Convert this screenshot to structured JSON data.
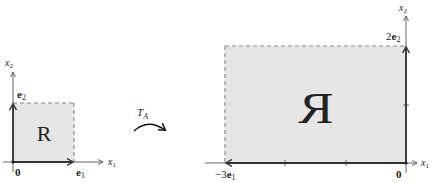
{
  "figure": {
    "colors": {
      "region_fill": "#e6e6e6",
      "axis": "#555555",
      "dashed_edge": "#8a8a8a",
      "text": "#222222",
      "background": "#ffffff"
    },
    "left_panel": {
      "axis_x_label": "x",
      "axis_x_sub": "1",
      "axis_y_label": "x",
      "axis_y_sub": "2",
      "origin_label": "0",
      "e1_label": "e",
      "e1_sub": "1",
      "e2_label": "e",
      "e2_sub": "2",
      "region_letter": "R"
    },
    "transform": {
      "label": "T",
      "label_sub": "A"
    },
    "right_panel": {
      "axis_x_label": "x",
      "axis_x_sub": "1",
      "axis_y_label": "x",
      "axis_y_sub": "2",
      "origin_label": "0",
      "neg3e1_prefix": "−3",
      "neg3e1_label": "e",
      "neg3e1_sub": "1",
      "two_e2_prefix": "2",
      "two_e2_label": "e",
      "two_e2_sub": "2",
      "region_letter": "R"
    }
  }
}
